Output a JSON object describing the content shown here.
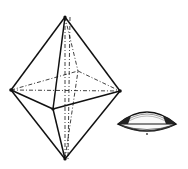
{
  "diagram": {
    "background": "#ffffff",
    "stroke": "#111111",
    "octahedron": {
      "vertices": {
        "top": [
          65,
          17
        ],
        "bottom": [
          65,
          159
        ],
        "left": [
          11,
          90
        ],
        "right": [
          120,
          91
        ],
        "front": [
          53,
          109
        ],
        "back": [
          78,
          71
        ]
      },
      "solid_edges": [
        [
          "top",
          "left"
        ],
        [
          "top",
          "right"
        ],
        [
          "top",
          "front"
        ],
        [
          "bottom",
          "left"
        ],
        [
          "bottom",
          "right"
        ],
        [
          "bottom",
          "front"
        ],
        [
          "left",
          "front"
        ],
        [
          "front",
          "right"
        ]
      ],
      "hidden_edges": [
        [
          "top",
          "back"
        ],
        [
          "bottom",
          "back"
        ],
        [
          "left",
          "back"
        ],
        [
          "back",
          "right"
        ],
        [
          "left",
          "right"
        ],
        [
          "top",
          "bottom"
        ]
      ]
    },
    "lens": {
      "cx": 147,
      "cy": 123,
      "rx": 29,
      "ry_top": 12,
      "ry_bottom": 8
    }
  }
}
